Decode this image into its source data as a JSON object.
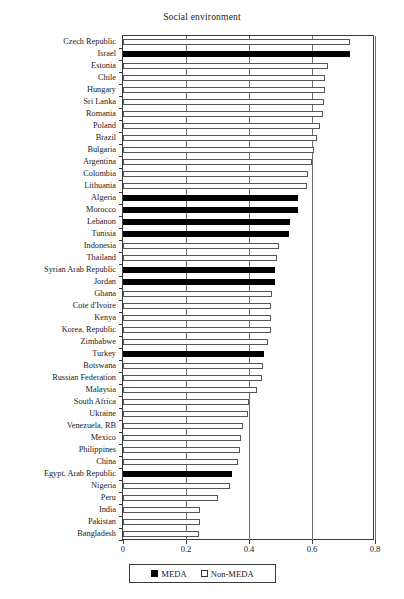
{
  "chart_data": {
    "type": "bar",
    "orientation": "horizontal",
    "title": "Social environment",
    "xlabel": "",
    "ylabel": "",
    "xlim": [
      0,
      0.8
    ],
    "xticks": [
      "0",
      "0.2",
      "0.4",
      "0.6",
      "0.8"
    ],
    "xtick_values": [
      0,
      0.2,
      0.4,
      0.6,
      0.8
    ],
    "grid": true,
    "legend_position": "bottom",
    "legend": [
      {
        "label": "MEDA",
        "key": "meda",
        "color": "#000000"
      },
      {
        "label": "Non-MEDA",
        "key": "nonmeda",
        "color": "#ffffff"
      }
    ],
    "categories": [
      "Czech Republic",
      "Israel",
      "Estonia",
      "Chile",
      "Hungary",
      "Sri Lanka",
      "Romania",
      "Poland",
      "Brazil",
      "Bulgaria",
      "Argentina",
      "Colombia",
      "Lithuania",
      "Algeria",
      "Morocco",
      "Lebanon",
      "Tunisia",
      "Indonesia",
      "Thailand",
      "Syrian Arab Republic",
      "Jordan",
      "Ghana",
      "Cote d'Ivoire",
      "Kenya",
      "Korea, Republic",
      "Zimbabwe",
      "Turkey",
      "Botswana",
      "Russian Federation",
      "Malaysia",
      "South Africa",
      "Ukraine",
      "Venezuela, RB",
      "Mexico",
      "Philippines",
      "China",
      "Egypt, Arab Republic",
      "Nigeria",
      "Peru",
      "India",
      "Pakistan",
      "Bangladesh"
    ],
    "values": [
      0.72,
      0.72,
      0.65,
      0.64,
      0.64,
      0.638,
      0.635,
      0.625,
      0.616,
      0.606,
      0.6,
      0.587,
      0.583,
      0.555,
      0.555,
      0.53,
      0.527,
      0.495,
      0.49,
      0.483,
      0.483,
      0.473,
      0.47,
      0.47,
      0.47,
      0.46,
      0.448,
      0.443,
      0.442,
      0.425,
      0.4,
      0.398,
      0.382,
      0.375,
      0.373,
      0.365,
      0.345,
      0.34,
      0.3,
      0.245,
      0.245,
      0.24
    ],
    "groups": [
      "nonmeda",
      "meda",
      "nonmeda",
      "nonmeda",
      "nonmeda",
      "nonmeda",
      "nonmeda",
      "nonmeda",
      "nonmeda",
      "nonmeda",
      "nonmeda",
      "nonmeda",
      "nonmeda",
      "meda",
      "meda",
      "meda",
      "meda",
      "nonmeda",
      "nonmeda",
      "meda",
      "meda",
      "nonmeda",
      "nonmeda",
      "nonmeda",
      "nonmeda",
      "nonmeda",
      "meda",
      "nonmeda",
      "nonmeda",
      "nonmeda",
      "nonmeda",
      "nonmeda",
      "nonmeda",
      "nonmeda",
      "nonmeda",
      "nonmeda",
      "meda",
      "nonmeda",
      "nonmeda",
      "nonmeda",
      "nonmeda",
      "nonmeda"
    ]
  }
}
